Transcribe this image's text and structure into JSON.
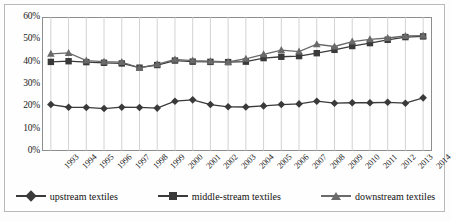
{
  "chart_data": {
    "type": "line",
    "title": "",
    "subtitle": "",
    "xlabel": "",
    "ylabel": "",
    "ylim": [
      0,
      60
    ],
    "yticks": [
      "0%",
      "10%",
      "20%",
      "30%",
      "40%",
      "50%",
      "60%"
    ],
    "ytick_values": [
      0,
      10,
      20,
      30,
      40,
      50,
      60
    ],
    "grid": "vertical",
    "legend_position": "bottom",
    "categories": [
      "1993",
      "1994",
      "1995",
      "1996",
      "1997",
      "1998",
      "1999",
      "2000",
      "2001",
      "2002",
      "2003",
      "2004",
      "2005",
      "2006",
      "2007",
      "2008",
      "2009",
      "2010",
      "2011",
      "2012",
      "2013",
      "2014"
    ],
    "series": [
      {
        "name": "upstream textiles",
        "marker": "diamond",
        "color": "#3a3a3a",
        "values": [
          20.8,
          19.6,
          19.5,
          19.0,
          19.6,
          19.5,
          19.2,
          22.3,
          22.9,
          20.8,
          19.8,
          19.7,
          20.2,
          20.8,
          21.1,
          22.3,
          21.4,
          21.6,
          21.6,
          21.8,
          21.4,
          23.8
        ]
      },
      {
        "name": "middle-stream textiles",
        "marker": "square",
        "color": "#3a3a3a",
        "values": [
          39.9,
          40.2,
          39.8,
          39.5,
          39.2,
          37.3,
          38.5,
          40.5,
          40.0,
          39.9,
          39.8,
          40.0,
          41.6,
          42.2,
          42.5,
          43.8,
          45.3,
          47.0,
          48.3,
          49.8,
          51.0,
          51.3
        ]
      },
      {
        "name": "downstream textiles",
        "marker": "triangle",
        "color": "#6a6a6a",
        "values": [
          43.5,
          43.9,
          40.5,
          40.0,
          39.8,
          37.2,
          38.8,
          41.0,
          40.5,
          40.2,
          39.9,
          41.3,
          43.3,
          45.2,
          44.5,
          47.8,
          46.8,
          49.0,
          50.0,
          50.6,
          51.5,
          51.7
        ]
      }
    ]
  },
  "legend": {
    "items": [
      {
        "label": "upstream textiles",
        "marker": "diamond"
      },
      {
        "label": "middle-stream textiles",
        "marker": "square"
      },
      {
        "label": "downstream textiles",
        "marker": "triangle"
      }
    ]
  }
}
